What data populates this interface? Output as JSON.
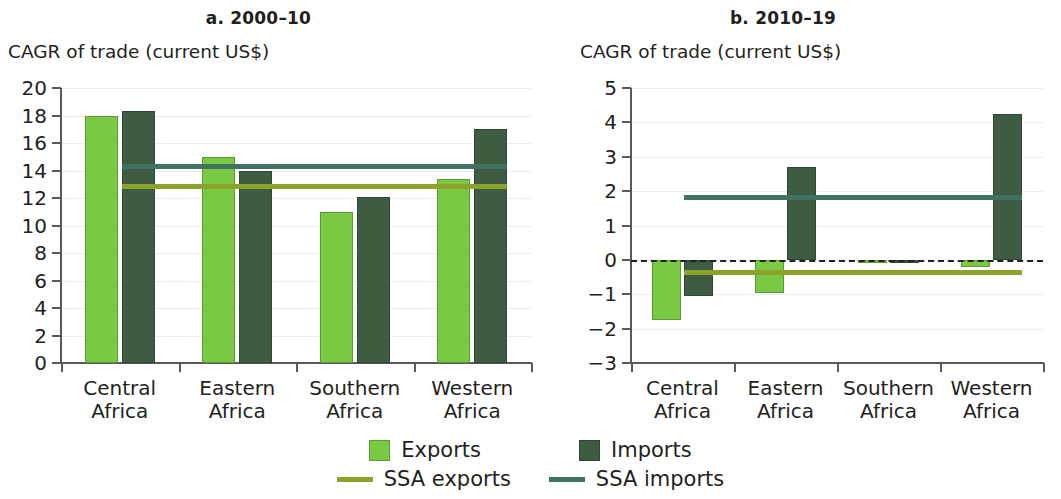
{
  "figure": {
    "legend": {
      "exports_label": "Exports",
      "imports_label": "Imports",
      "ssa_exports_label": "SSA exports",
      "ssa_imports_label": "SSA imports",
      "exports_color": "#7ac943",
      "imports_color": "#3d5c42",
      "ssa_exports_color": "#8ba32a",
      "ssa_imports_color": "#3f7260"
    }
  },
  "chart_data": [
    {
      "type": "bar",
      "panel": "a",
      "title": "a. 2000–10",
      "subtitle": "CAGR of trade (current US$)",
      "ylabel": "CAGR of trade (current US$)",
      "xlabel": "",
      "categories": [
        "Central Africa",
        "Eastern Africa",
        "Southern Africa",
        "Western Africa"
      ],
      "category_lines": [
        [
          "Central",
          "Africa"
        ],
        [
          "Eastern",
          "Africa"
        ],
        [
          "Southern",
          "Africa"
        ],
        [
          "Western",
          "Africa"
        ]
      ],
      "series": [
        {
          "name": "Exports",
          "values": [
            18.0,
            15.0,
            11.0,
            13.4
          ],
          "color": "#7ac943"
        },
        {
          "name": "Imports",
          "values": [
            18.3,
            14.0,
            12.1,
            17.0
          ],
          "color": "#3d5c42"
        }
      ],
      "reference_lines": [
        {
          "name": "SSA exports",
          "value": 13.0,
          "color": "#8ba32a"
        },
        {
          "name": "SSA imports",
          "value": 14.5,
          "color": "#3f7260"
        }
      ],
      "ylim": [
        0,
        20
      ],
      "ytick_step": 2,
      "yticks": [
        0,
        2,
        4,
        6,
        8,
        10,
        12,
        14,
        16,
        18,
        20
      ],
      "ytick_labels": [
        "0",
        "2",
        "4",
        "6",
        "8",
        "10",
        "12",
        "14",
        "16",
        "18",
        "20"
      ],
      "grid": true,
      "zero_line": false,
      "legend_position": "bottom"
    },
    {
      "type": "bar",
      "panel": "b",
      "title": "b. 2010–19",
      "subtitle": "CAGR of trade (current US$)",
      "ylabel": "CAGR of trade (current US$)",
      "xlabel": "",
      "categories": [
        "Central Africa",
        "Eastern Africa",
        "Southern Africa",
        "Western Africa"
      ],
      "category_lines": [
        [
          "Central",
          "Africa"
        ],
        [
          "Eastern",
          "Africa"
        ],
        [
          "Southern",
          "Africa"
        ],
        [
          "Western",
          "Africa"
        ]
      ],
      "series": [
        {
          "name": "Exports",
          "values": [
            -1.75,
            -0.95,
            -0.1,
            -0.2
          ],
          "color": "#7ac943"
        },
        {
          "name": "Imports",
          "values": [
            -1.05,
            2.7,
            -0.1,
            4.25
          ],
          "color": "#3d5c42"
        }
      ],
      "reference_lines": [
        {
          "name": "SSA exports",
          "value": -0.3,
          "color": "#8ba32a"
        },
        {
          "name": "SSA imports",
          "value": 1.9,
          "color": "#3f7260"
        }
      ],
      "ylim": [
        -3,
        5
      ],
      "ytick_step": 1,
      "yticks": [
        -3,
        -2,
        -1,
        0,
        1,
        2,
        3,
        4,
        5
      ],
      "ytick_labels": [
        "−3",
        "−2",
        "−1",
        "0",
        "1",
        "2",
        "3",
        "4",
        "5"
      ],
      "grid": true,
      "zero_line": true,
      "legend_position": "bottom"
    }
  ]
}
